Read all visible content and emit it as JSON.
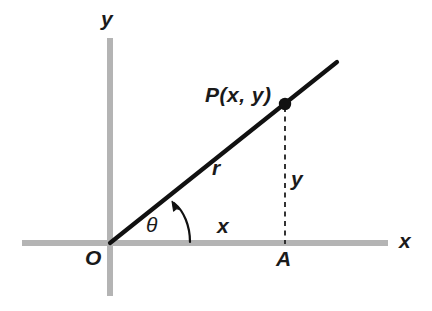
{
  "figure": {
    "kind": "trigonometry-right-triangle-diagram",
    "background_color": "#ffffff",
    "axis_color": "#b4b4b4",
    "ink_color": "#111111"
  },
  "labels": {
    "axis_y": "y",
    "axis_x": "x",
    "origin": "O",
    "foot_point": "A",
    "point": "P(x, y)",
    "hypotenuse": "r",
    "angle": "θ",
    "leg_horizontal": "x",
    "leg_vertical": "y"
  },
  "geometry": {
    "origin_px": [
      110,
      243
    ],
    "point_p_px": [
      285,
      104
    ],
    "foot_a_px": [
      285,
      243
    ],
    "ray_end_px": [
      337,
      62
    ],
    "x_axis_span_px": [
      22,
      388
    ],
    "y_axis_span_px": [
      38,
      296
    ],
    "angle_arc_start_px": [
      190,
      243
    ],
    "angle_arc_end_px": [
      172,
      202
    ],
    "angle_degrees": 38
  }
}
